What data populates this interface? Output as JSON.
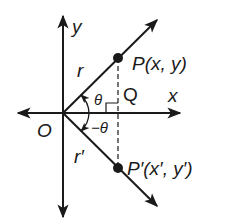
{
  "diagram": {
    "colors": {
      "ink": "#1a1a1a",
      "background": "#ffffff"
    },
    "axes": {
      "x_label": "x",
      "y_label": "y",
      "origin_label": "O"
    },
    "points": {
      "P": {
        "label": "P(x, y)"
      },
      "P_prime": {
        "label": "P′(x′, y′)"
      },
      "Q": {
        "label": "Q"
      }
    },
    "segments": {
      "r": {
        "label": "r"
      },
      "r_prime": {
        "label": "r′"
      }
    },
    "angles": {
      "theta": {
        "label": "θ"
      },
      "neg_theta": {
        "label": "−θ"
      }
    }
  }
}
